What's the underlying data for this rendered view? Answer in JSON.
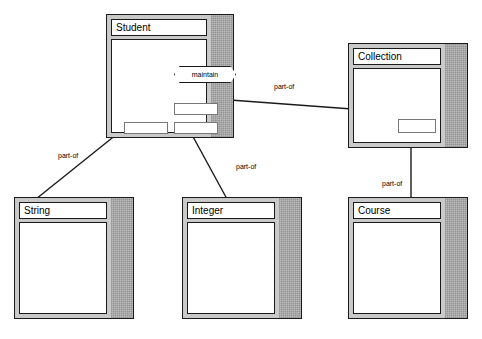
{
  "diagram": {
    "background_color": "#ffffff",
    "line_color": "#1a1a1a",
    "box_border_color": "#1a1a1a",
    "box_fill_color": "#ffffff",
    "box_shadow_color": "#b9b9b9",
    "slot_border_color": "#777777"
  },
  "classes": [
    {
      "id": "student",
      "label": "Student",
      "x": 106,
      "y": 14,
      "w": 128,
      "h": 124,
      "slots": [
        {
          "id": "student-slot-upper",
          "x": 62,
          "y": 63,
          "w": 44,
          "h": 12
        },
        {
          "id": "student-slot-left",
          "x": 12,
          "y": 82,
          "w": 44,
          "h": 12
        },
        {
          "id": "student-slot-mid",
          "x": 62,
          "y": 82,
          "w": 44,
          "h": 12
        }
      ],
      "nodes": [
        {
          "id": "maintain-node",
          "label": "maintain",
          "x": 62,
          "y": 26,
          "w": 62,
          "h": 17
        }
      ]
    },
    {
      "id": "collection",
      "label": "Collection",
      "x": 348,
      "y": 43,
      "w": 120,
      "h": 105,
      "slots": [
        {
          "id": "collection-slot",
          "x": 44,
          "y": 50,
          "w": 38,
          "h": 14
        }
      ],
      "nodes": []
    },
    {
      "id": "string",
      "label": "String",
      "x": 14,
      "y": 197,
      "w": 120,
      "h": 122,
      "slots": [],
      "nodes": []
    },
    {
      "id": "integer",
      "label": "Integer",
      "x": 182,
      "y": 197,
      "w": 120,
      "h": 122,
      "slots": [],
      "nodes": []
    },
    {
      "id": "course",
      "label": "Course",
      "x": 348,
      "y": 197,
      "w": 120,
      "h": 122,
      "slots": [],
      "nodes": []
    }
  ],
  "edges": [
    {
      "id": "edge-student-string",
      "label": "part-of",
      "from": "student",
      "to": "string",
      "x1": 132,
      "y1": 122,
      "x2": 36,
      "y2": 199,
      "label_x": 57,
      "label_y": 152
    },
    {
      "id": "edge-student-integer",
      "label": "part-of",
      "from": "student",
      "to": "integer",
      "x1": 185,
      "y1": 122,
      "x2": 227,
      "y2": 199,
      "label_x": 235,
      "label_y": 163
    },
    {
      "id": "edge-student-collection",
      "label": "part-of",
      "from": "student",
      "to": "collection",
      "x1": 176,
      "y1": 96,
      "x2": 352,
      "y2": 109,
      "label_x": 273,
      "label_y": 83
    },
    {
      "id": "edge-collection-course",
      "label": "part-of",
      "from": "collection",
      "to": "course",
      "x1": 411,
      "y1": 104,
      "x2": 411,
      "y2": 199,
      "label_x": 381,
      "label_y": 180
    }
  ]
}
